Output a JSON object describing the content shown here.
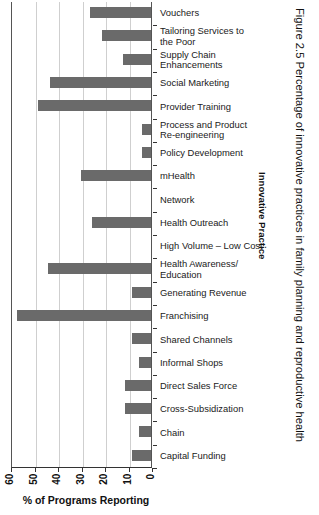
{
  "chart_data": {
    "type": "bar",
    "orientation": "horizontal",
    "title": "Figure 2.5 Percentage of innovative practices in family planning and reproductive health",
    "xlabel": "% of Programs Reporting",
    "ylabel": "Innovative Practice",
    "xlim": [
      60,
      0
    ],
    "x_axis_reversed": true,
    "xticks": [
      60,
      50,
      40,
      30,
      20,
      10,
      0
    ],
    "xtick_labels": [
      "60",
      "50",
      "40",
      "30",
      "20",
      "10",
      "0"
    ],
    "grid": true,
    "legend": null,
    "bar_color": "#6a6a6a",
    "categories": [
      "Vouchers",
      "Tailoring Services to the Poor",
      "Supply Chain Enhancements",
      "Social Marketing",
      "Provider Training",
      "Process and Product Re-engineering",
      "Policy Development",
      "mHealth",
      "Network",
      "Health Outreach",
      "High Volume – Low Cost",
      "Health Awareness/ Education",
      "Generating Revenue",
      "Franchising",
      "Shared Channels",
      "Informal Shops",
      "Direct Sales Force",
      "Cross-Subsidization",
      "Chain",
      "Capital Funding"
    ],
    "values": [
      26,
      21,
      12,
      43,
      48,
      4,
      4,
      30,
      0,
      25,
      0,
      44,
      8,
      57,
      8,
      5,
      11,
      11,
      5,
      8
    ]
  },
  "axis": {
    "x_title": "% of Programs Reporting",
    "y_title": "Innovative Practice"
  },
  "caption": {
    "text": "Figure 2.5 Percentage of innovative practices in family planning and reproductive health"
  },
  "xticks": [
    {
      "label": "60",
      "value": 60
    },
    {
      "label": "50",
      "value": 50
    },
    {
      "label": "40",
      "value": 40
    },
    {
      "label": "30",
      "value": 30
    },
    {
      "label": "20",
      "value": 20
    },
    {
      "label": "10",
      "value": 10
    },
    {
      "label": "0",
      "value": 0
    }
  ],
  "categories": [
    {
      "label": "Vouchers",
      "value": 26
    },
    {
      "label": "Tailoring Services to\nthe Poor",
      "value": 21
    },
    {
      "label": "Supply Chain\nEnhancements",
      "value": 12
    },
    {
      "label": "Social Marketing",
      "value": 43
    },
    {
      "label": "Provider Training",
      "value": 48
    },
    {
      "label": "Process and Product\nRe-engineering",
      "value": 4
    },
    {
      "label": "Policy Development",
      "value": 4
    },
    {
      "label": "mHealth",
      "value": 30
    },
    {
      "label": "Network",
      "value": 0
    },
    {
      "label": "Health Outreach",
      "value": 25
    },
    {
      "label": "High Volume – Low Cost",
      "value": 0
    },
    {
      "label": "Health Awareness/\nEducation",
      "value": 44
    },
    {
      "label": "Generating Revenue",
      "value": 8
    },
    {
      "label": "Franchising",
      "value": 57
    },
    {
      "label": "Shared Channels",
      "value": 8
    },
    {
      "label": "Informal Shops",
      "value": 5
    },
    {
      "label": "Direct Sales Force",
      "value": 11
    },
    {
      "label": "Cross-Subsidization",
      "value": 11
    },
    {
      "label": "Chain",
      "value": 5
    },
    {
      "label": "Capital Funding",
      "value": 8
    }
  ]
}
